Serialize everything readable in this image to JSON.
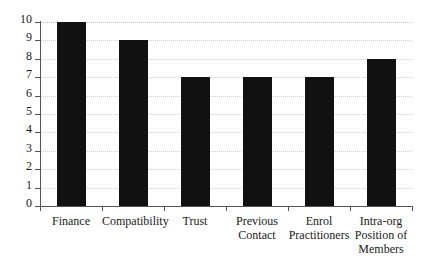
{
  "chart_data": {
    "type": "bar",
    "title": "",
    "subtitle": "",
    "xlabel": "",
    "ylabel": "",
    "categories": [
      "Finance",
      "Compatibility",
      "Trust",
      "Previous Contact",
      "Enrol Practitioners",
      "Intra-org Position of Members"
    ],
    "category_lines": [
      [
        "Finance"
      ],
      [
        "Compatibility"
      ],
      [
        "Trust"
      ],
      [
        "Previous",
        "Contact"
      ],
      [
        "Enrol",
        "Practitioners"
      ],
      [
        "Intra-org",
        "Position of",
        "Members"
      ]
    ],
    "values": [
      10,
      9,
      7,
      7,
      7,
      8
    ],
    "ylim": [
      0,
      10
    ],
    "ytick_labels": [
      "0",
      "1",
      "2",
      "3",
      "4",
      "5",
      "6",
      "7",
      "8",
      "9",
      "10"
    ],
    "ytick_values": [
      0,
      1,
      2,
      3,
      4,
      5,
      6,
      7,
      8,
      9,
      10
    ],
    "grid": "horizontal-dotted",
    "legend": "none",
    "bar_color": "#111111",
    "grid_color": "#cfcfcf",
    "axis_color": "#555555",
    "background_color": "#ffffff"
  }
}
